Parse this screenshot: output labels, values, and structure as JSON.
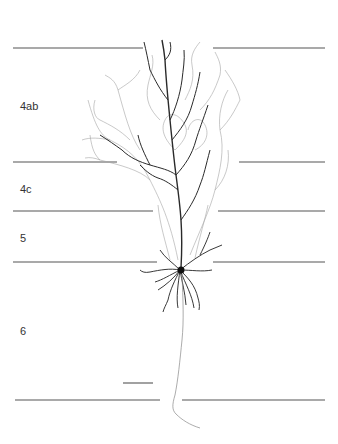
{
  "figure": {
    "type": "neuron-reconstruction",
    "layers": [
      {
        "label": "4ab",
        "x": 20,
        "y": 100
      },
      {
        "label": "4c",
        "x": 20,
        "y": 183
      },
      {
        "label": "5",
        "x": 20,
        "y": 232
      },
      {
        "label": "6",
        "x": 20,
        "y": 325
      }
    ],
    "boundaries": [
      {
        "y": 48,
        "left": [
          13,
          143
        ],
        "right": [
          213,
          325
        ]
      },
      {
        "y": 162,
        "left": [
          13,
          117
        ],
        "right": [
          239,
          325
        ]
      },
      {
        "y": 211,
        "left": [
          13,
          153
        ],
        "right": [
          218,
          325
        ]
      },
      {
        "y": 262,
        "left": [
          13,
          157
        ],
        "right": [
          213,
          325
        ]
      },
      {
        "y": 400,
        "left": [
          15,
          160
        ],
        "right": [
          182,
          325
        ]
      }
    ],
    "scale_bar": {
      "x1": 123,
      "x2": 153,
      "y": 383
    },
    "soma": {
      "x": 180,
      "y": 270
    },
    "colors": {
      "line": "#555555",
      "dendrite_dark": "#222222",
      "dendrite_light": "#9a9a9a",
      "background": "#ffffff"
    }
  }
}
